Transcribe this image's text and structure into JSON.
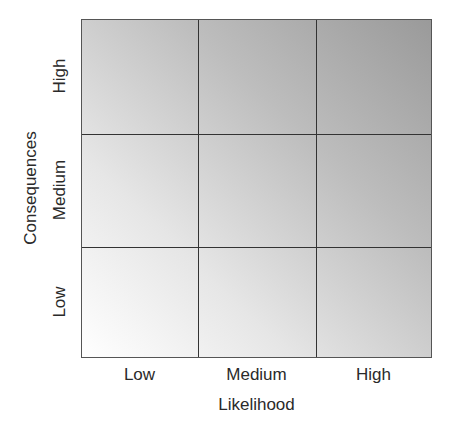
{
  "diagram": {
    "type": "risk-matrix",
    "rows": 3,
    "columns": 3,
    "x_axis": {
      "label": "Likelihood",
      "ticks": [
        "Low",
        "Medium",
        "High"
      ]
    },
    "y_axis": {
      "label": "Consequences",
      "ticks": [
        "Low",
        "Medium",
        "High"
      ]
    },
    "shading": {
      "from_color": "#ffffff",
      "to_color": "#9a9a9a",
      "direction": "bottom-left to top-right"
    }
  }
}
